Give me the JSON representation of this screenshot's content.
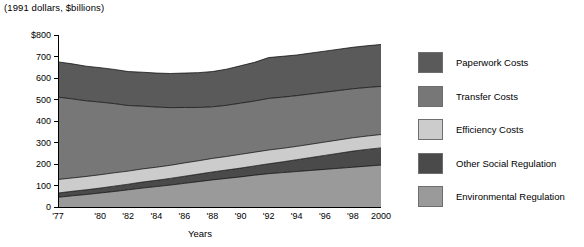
{
  "title": "(1991 dollars, $billions)",
  "axis": {
    "x_title": "Years",
    "y_ticks": [
      "$800",
      "700",
      "600",
      "500",
      "400",
      "300",
      "200",
      "100",
      "0"
    ]
  },
  "legend": {
    "items": [
      {
        "label": "Paperwork Costs",
        "color": "#5a5a5a"
      },
      {
        "label": "Transfer Costs",
        "color": "#777777"
      },
      {
        "label": "Efficiency Costs",
        "color": "#cccccc"
      },
      {
        "label": "Other Social Regulation",
        "color": "#4a4a4a"
      },
      {
        "label": "Environmental Regulation",
        "color": "#9a9a9a"
      }
    ]
  },
  "chart_data": {
    "type": "area",
    "title": "(1991 dollars, $billions)",
    "xlabel": "Years",
    "ylabel": "",
    "ylim": [
      0,
      800
    ],
    "grid": false,
    "legend_position": "right",
    "stacked": true,
    "x": [
      1977,
      1978,
      1979,
      1980,
      1981,
      1982,
      1983,
      1984,
      1985,
      1986,
      1987,
      1988,
      1989,
      1990,
      1991,
      1992,
      1993,
      1994,
      1995,
      1996,
      1997,
      1998,
      1999,
      2000
    ],
    "tick_labels": [
      "'77",
      "'80",
      "'82",
      "'84",
      "'86",
      "'88",
      "'90",
      "'92",
      "'94",
      "'96",
      "'98",
      "2000"
    ],
    "tick_years": [
      1977,
      1980,
      1982,
      1984,
      1986,
      1988,
      1990,
      1992,
      1994,
      1996,
      1998,
      2000
    ],
    "series": [
      {
        "name": "Environmental Regulation",
        "color": "#9a9a9a",
        "values": [
          45,
          52,
          58,
          65,
          72,
          80,
          88,
          95,
          102,
          110,
          118,
          126,
          133,
          140,
          148,
          155,
          160,
          165,
          170,
          175,
          180,
          185,
          190,
          195
        ]
      },
      {
        "name": "Other Social Regulation",
        "color": "#4a4a4a",
        "values": [
          20,
          21,
          22,
          23,
          25,
          26,
          28,
          29,
          31,
          33,
          35,
          37,
          39,
          41,
          43,
          46,
          50,
          55,
          60,
          65,
          70,
          75,
          78,
          80
        ]
      },
      {
        "name": "Efficiency Costs",
        "color": "#cccccc",
        "values": [
          63,
          62,
          62,
          62,
          62,
          61,
          61,
          61,
          61,
          62,
          62,
          63,
          63,
          64,
          64,
          64,
          63,
          62,
          62,
          62,
          62,
          62,
          62,
          62
        ]
      },
      {
        "name": "Transfer Costs",
        "color": "#777777",
        "values": [
          383,
          368,
          352,
          338,
          322,
          305,
          292,
          280,
          268,
          258,
          248,
          240,
          238,
          238,
          238,
          240,
          238,
          236,
          234,
          232,
          230,
          228,
          226,
          224
        ]
      },
      {
        "name": "Paperwork Costs",
        "color": "#5a5a5a",
        "values": [
          164,
          163,
          161,
          160,
          159,
          158,
          158,
          158,
          159,
          160,
          162,
          164,
          168,
          174,
          180,
          190,
          190,
          189,
          190,
          191,
          192,
          193,
          194,
          195
        ]
      }
    ],
    "totals": [
      675,
      666,
      655,
      648,
      640,
      630,
      627,
      623,
      621,
      623,
      625,
      630,
      641,
      657,
      673,
      695,
      701,
      707,
      716,
      725,
      734,
      743,
      750,
      756
    ]
  }
}
